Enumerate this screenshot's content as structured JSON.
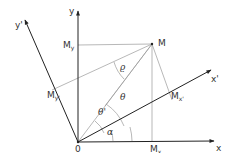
{
  "diagram": {
    "labels": {
      "origin": "0",
      "x_axis": "x",
      "y_axis": "y",
      "x_prime_axis": "x'",
      "y_prime_axis": "y'",
      "point": "M",
      "my_main": "M",
      "my_sub": "y",
      "mx_main": "M",
      "mx_sub": "x",
      "mxp_main": "M",
      "mxp_sub": "x'",
      "myp_main": "M",
      "myp_sub": "y'",
      "alpha": "α",
      "theta": "θ",
      "theta_prime": "θ'",
      "rho": "ϱ"
    },
    "colors": {
      "axis": "#333333",
      "projection": "#888888"
    }
  }
}
